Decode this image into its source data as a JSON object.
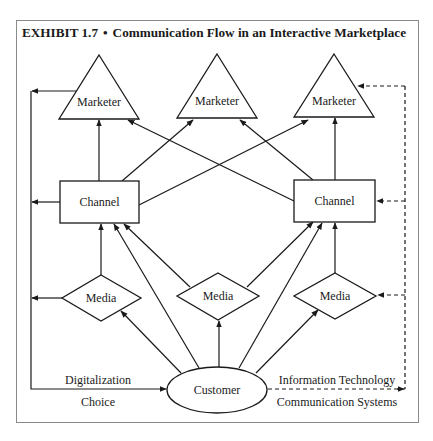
{
  "exhibit": {
    "label": "EXHIBIT 1.7",
    "separator": "•",
    "title": "Communication Flow in an Interactive Marketplace"
  },
  "nodes": {
    "marketer_left": "Marketer",
    "marketer_center": "Marketer",
    "marketer_right": "Marketer",
    "channel_left": "Channel",
    "channel_right": "Channel",
    "media_left": "Media",
    "media_center": "Media",
    "media_right": "Media",
    "customer": "Customer"
  },
  "edge_labels": {
    "left_top": "Digitalization",
    "left_bottom": "Choice",
    "right_top": "Information Technology",
    "right_bottom": "Communication Systems"
  },
  "colors": {
    "stroke": "#1a1a1a",
    "frame": "#8a8a8a",
    "background": "#ffffff"
  }
}
